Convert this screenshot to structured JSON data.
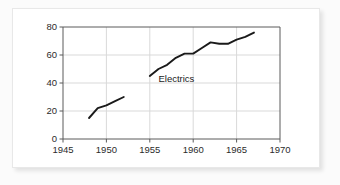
{
  "chart_data": {
    "type": "line",
    "title": "",
    "subtitle": "",
    "xlabel": "",
    "ylabel": "",
    "xlim": [
      1945,
      1970
    ],
    "ylim": [
      0,
      80
    ],
    "xticks": [
      1945,
      1950,
      1955,
      1960,
      1965,
      1970
    ],
    "yticks": [
      0,
      20,
      40,
      60,
      80
    ],
    "xtick_labels": [
      "1945",
      "1950",
      "1955",
      "1960",
      "1965",
      "1970"
    ],
    "ytick_labels": [
      "0",
      "20",
      "40",
      "60",
      "80"
    ],
    "grid": "horizontal-and-vertical",
    "legend_position": "none",
    "series": [
      {
        "name": "segment-early",
        "x": [
          1948,
          1949,
          1950,
          1951,
          1952
        ],
        "values": [
          15,
          22,
          24,
          27,
          30
        ]
      },
      {
        "name": "segment-late",
        "x": [
          1955,
          1956,
          1957,
          1958,
          1959,
          1960,
          1961,
          1962,
          1963,
          1964,
          1965,
          1966,
          1967
        ],
        "values": [
          45,
          50,
          53,
          58,
          61,
          61,
          65,
          69,
          68,
          68,
          71,
          73,
          76
        ]
      }
    ],
    "annotations": [
      {
        "text": "Electrics",
        "x": 1956,
        "y": 41
      }
    ],
    "colors": {
      "line": "#1a1a1a",
      "grid": "#d9d9d9",
      "axis": "#5a5a5a",
      "text": "#2b2b2b",
      "plot_background": "#ffffff",
      "card_background": "#ffffff",
      "page_background": "#fbfbfb"
    }
  }
}
